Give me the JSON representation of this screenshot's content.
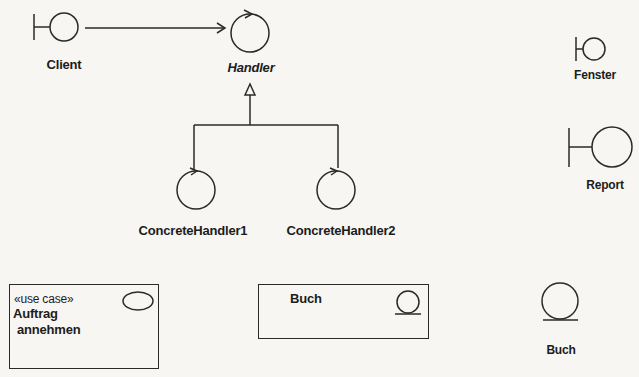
{
  "diagram": {
    "type": "UML stereotype icons / robustness diagram",
    "colors": {
      "background": "#f7f6f3",
      "stroke": "#2a2a2a",
      "text": "#1c1c1c"
    },
    "nodes": [
      {
        "id": "client",
        "label": "Client",
        "kind": "boundary-icon"
      },
      {
        "id": "handler",
        "label": "Handler",
        "kind": "control-icon",
        "italic": true
      },
      {
        "id": "concrete_handler_1",
        "label": "ConcreteHandler1",
        "kind": "control-icon"
      },
      {
        "id": "concrete_handler_2",
        "label": "ConcreteHandler2",
        "kind": "control-icon"
      },
      {
        "id": "fenster",
        "label": "Fenster",
        "kind": "boundary-icon"
      },
      {
        "id": "report",
        "label": "Report",
        "kind": "boundary-icon"
      },
      {
        "id": "buch_entity",
        "label": "Buch",
        "kind": "entity-icon"
      }
    ],
    "edges": [
      {
        "from": "client",
        "to": "handler",
        "kind": "association-arrow"
      },
      {
        "from": "concrete_handler_1",
        "to": "handler",
        "kind": "generalization"
      },
      {
        "from": "concrete_handler_2",
        "to": "handler",
        "kind": "generalization"
      }
    ],
    "boxes": {
      "use_case": {
        "stereotype": "«use case»",
        "name_line1": "Auftrag",
        "name_line2": "annehmen",
        "icon": "ellipse-icon"
      },
      "entity_box": {
        "name": "Buch",
        "icon": "entity-icon"
      }
    }
  },
  "labels": {
    "client": "Client",
    "handler": "Handler",
    "concrete_handler_1": "ConcreteHandler1",
    "concrete_handler_2": "ConcreteHandler2",
    "fenster": "Fenster",
    "report": "Report",
    "buch": "Buch",
    "use_case_stereotype": "«use case»",
    "use_case_line1": "Auftrag",
    "use_case_line2": "annehmen",
    "buch_box_name": "Buch"
  }
}
